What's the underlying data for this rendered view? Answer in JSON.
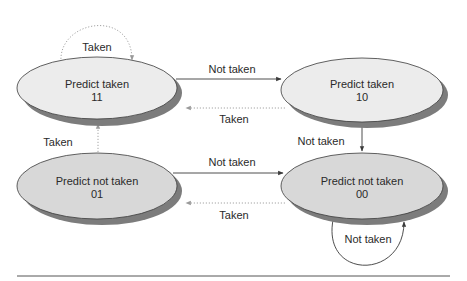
{
  "diagram": {
    "type": "state-machine",
    "colors": {
      "predict_taken_fill": "#ececec",
      "predict_not_taken_fill": "#d8d8d8",
      "shadow": "#7c7c7c",
      "solid_edge": "#3a3a3a",
      "dotted_edge": "#9a9a9a"
    },
    "states": [
      {
        "id": "11",
        "label": "Predict taken",
        "code": "11"
      },
      {
        "id": "10",
        "label": "Predict taken",
        "code": "10"
      },
      {
        "id": "01",
        "label": "Predict not taken",
        "code": "01"
      },
      {
        "id": "00",
        "label": "Predict not taken",
        "code": "00"
      }
    ],
    "transitions": [
      {
        "from": "11",
        "to": "11",
        "label": "Taken",
        "style": "dotted"
      },
      {
        "from": "11",
        "to": "10",
        "label": "Not taken",
        "style": "solid"
      },
      {
        "from": "10",
        "to": "11",
        "label": "Taken",
        "style": "dotted"
      },
      {
        "from": "10",
        "to": "00",
        "label": "Not taken",
        "style": "solid"
      },
      {
        "from": "01",
        "to": "11",
        "label": "Taken",
        "style": "dotted"
      },
      {
        "from": "01",
        "to": "00",
        "label": "Not taken",
        "style": "solid"
      },
      {
        "from": "00",
        "to": "01",
        "label": "Taken",
        "style": "dotted"
      },
      {
        "from": "00",
        "to": "00",
        "label": "Not taken",
        "style": "solid"
      }
    ]
  }
}
